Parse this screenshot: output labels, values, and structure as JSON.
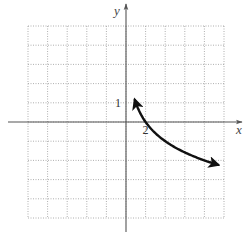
{
  "chart_data": {
    "type": "line",
    "title": "",
    "xlabel": "x",
    "ylabel": "y",
    "grid": true,
    "xlim": [
      -10,
      10
    ],
    "ylim": [
      -5,
      5
    ],
    "x_grid_step": 2,
    "y_grid_step": 1,
    "tick_labels": [
      {
        "axis": "y",
        "value": 1,
        "text": "1"
      },
      {
        "axis": "x",
        "value": 2,
        "text": "2"
      }
    ],
    "series": [
      {
        "name": "y = 1 - log2(x)",
        "function": "1 - log2(x)",
        "domain": [
          0.9,
          9.4
        ],
        "arrows": "both",
        "color": "#111111",
        "points": [
          [
            0.9,
            1.15
          ],
          [
            1,
            1
          ],
          [
            1.5,
            0.42
          ],
          [
            2,
            0
          ],
          [
            3,
            -0.58
          ],
          [
            4,
            -1
          ],
          [
            5,
            -1.32
          ],
          [
            6,
            -1.58
          ],
          [
            7,
            -1.81
          ],
          [
            8,
            -2
          ],
          [
            9.4,
            -2.23
          ]
        ]
      }
    ]
  }
}
